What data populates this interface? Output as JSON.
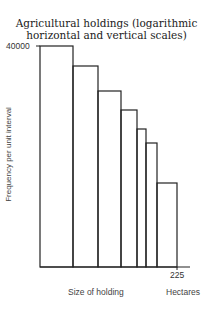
{
  "chart_data": {
    "type": "bar",
    "subtype": "histogram",
    "title": "Agricultural holdings (logarithmic horizontal and vertical scales)",
    "title_lines": [
      "Agricultural holdings (logarithmic",
      "horizontal and vertical scales)"
    ],
    "xlabel": "Size of holding",
    "xunit": "Hectares",
    "ylabel": "Frequency per unit interval",
    "y_tick_labels": [
      "40000"
    ],
    "x_tick_labels": [
      "225"
    ],
    "x_scale": "log",
    "y_scale": "log",
    "grid": false,
    "legend": "none",
    "bars": [
      {
        "x0": 40,
        "x1": 73,
        "top": 46
      },
      {
        "x0": 73,
        "x1": 98,
        "top": 66
      },
      {
        "x0": 98,
        "x1": 121,
        "top": 91
      },
      {
        "x0": 121,
        "x1": 137,
        "top": 110
      },
      {
        "x0": 137,
        "x1": 146,
        "top": 129
      },
      {
        "x0": 146,
        "x1": 157,
        "top": 143
      },
      {
        "x0": 157,
        "x1": 177,
        "top": 183
      }
    ],
    "relative_heights": [
      1.0,
      0.91,
      0.8,
      0.71,
      0.63,
      0.56,
      0.38
    ],
    "ymax": 40000,
    "xmax_label": 225
  }
}
